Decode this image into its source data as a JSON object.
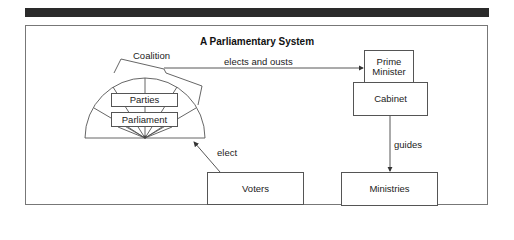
{
  "diagram": {
    "title": "A Parliamentary System",
    "nodes": {
      "coalition": "Coalition",
      "parties": "Parties",
      "parliament": "Parliament",
      "prime_minister_line1": "Prime",
      "prime_minister_line2": "Minister",
      "cabinet": "Cabinet",
      "voters": "Voters",
      "ministries": "Ministries"
    },
    "edges": {
      "parliament_to_pm": "elects and ousts",
      "voters_to_parliament": "elect",
      "cabinet_to_ministries": "guides"
    },
    "colors": {
      "header_bar": "#2a2a2a",
      "line": "#555555",
      "text": "#222222"
    }
  }
}
